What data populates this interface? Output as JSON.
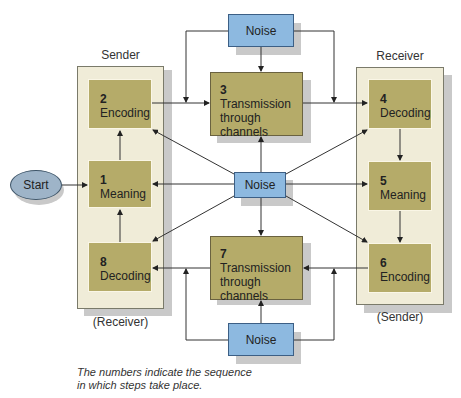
{
  "diagram": {
    "sender_label": "Sender",
    "receiver_label": "Receiver",
    "sender_bottom_label": "(Receiver)",
    "receiver_bottom_label": "(Sender)",
    "start": "Start",
    "steps": [
      {
        "num": "1",
        "label": "Meaning"
      },
      {
        "num": "2",
        "label": "Encoding"
      },
      {
        "num": "3",
        "label": "Transmission through channels"
      },
      {
        "num": "4",
        "label": "Decoding"
      },
      {
        "num": "5",
        "label": "Meaning"
      },
      {
        "num": "6",
        "label": "Encoding"
      },
      {
        "num": "7",
        "label": "Transmission through channels"
      },
      {
        "num": "8",
        "label": "Decoding"
      }
    ],
    "step3_line1": "Transmission",
    "step3_line2": "through channels",
    "step7_line1": "Transmission",
    "step7_line2": "through channels",
    "noise_top": "Noise",
    "noise_center": "Noise",
    "noise_bottom": "Noise",
    "note_line1": "The numbers indicate the sequence",
    "note_line2": "in which steps take place."
  },
  "colors": {
    "panel": "#f0ecd8",
    "step_box": "#b5ab69",
    "noise": "#8db9e0",
    "start": "#9eb4c8"
  }
}
